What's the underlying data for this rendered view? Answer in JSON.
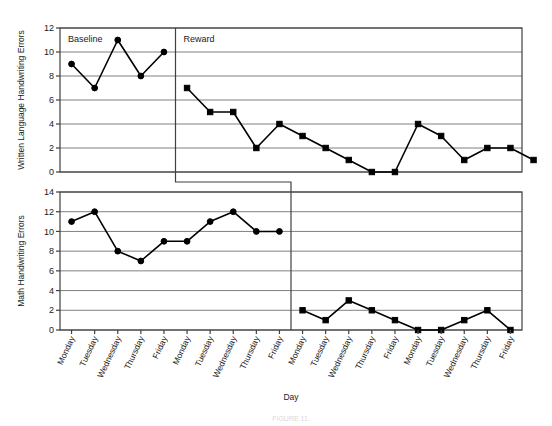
{
  "figure": {
    "xlabel": "Day",
    "caption": "FIGURE 11."
  },
  "chart_data": [
    {
      "type": "line",
      "title": "",
      "xlabel": "Day",
      "ylabel": "Written Language Handwriting Errors",
      "ylim": [
        0,
        12
      ],
      "yticks": [
        0,
        2,
        4,
        6,
        8,
        10,
        12
      ],
      "grid": true,
      "legend": "none",
      "categories": [
        "Monday",
        "Tuesday",
        "Wednesday",
        "Thursday",
        "Friday",
        "Monday",
        "Tuesday",
        "Wednesday",
        "Thursday",
        "Friday",
        "Monday",
        "Tuesday",
        "Wednesday",
        "Thursday",
        "Friday",
        "Monday",
        "Tuesday",
        "Wednesday",
        "Thursday",
        "Friday"
      ],
      "phases": [
        {
          "label": "Baseline",
          "marker": "circle",
          "start_index": 0,
          "end_index": 4,
          "values": [
            9,
            7,
            11,
            8,
            10
          ]
        },
        {
          "label": "Reward",
          "marker": "square",
          "start_index": 5,
          "end_index": 19,
          "values": [
            7,
            5,
            5,
            2,
            4,
            3,
            2,
            1,
            0,
            0,
            4,
            3,
            1,
            2,
            2,
            1
          ]
        }
      ],
      "values": [
        9,
        7,
        11,
        8,
        10,
        7,
        5,
        5,
        2,
        4,
        3,
        2,
        1,
        0,
        0,
        4,
        3,
        1,
        2,
        2,
        1
      ],
      "phase_change_after_index": 4
    },
    {
      "type": "line",
      "title": "",
      "xlabel": "Day",
      "ylabel": "Math Handwriting Errors",
      "ylim": [
        0,
        14
      ],
      "yticks": [
        0,
        2,
        4,
        6,
        8,
        10,
        12,
        14
      ],
      "grid": true,
      "legend": "none",
      "categories": [
        "Monday",
        "Tuesday",
        "Wednesday",
        "Thursday",
        "Friday",
        "Monday",
        "Tuesday",
        "Wednesday",
        "Thursday",
        "Friday",
        "Monday",
        "Tuesday",
        "Wednesday",
        "Thursday",
        "Friday",
        "Monday",
        "Tuesday",
        "Wednesday",
        "Thursday",
        "Friday"
      ],
      "phases": [
        {
          "label": "Baseline",
          "marker": "circle",
          "start_index": 0,
          "end_index": 10,
          "values": [
            11,
            12,
            8,
            7,
            9,
            9,
            11,
            12,
            10,
            10
          ]
        },
        {
          "label": "Reward",
          "marker": "square",
          "start_index": 11,
          "end_index": 19,
          "values": [
            2,
            1,
            3,
            2,
            1,
            0,
            0,
            1,
            2,
            0
          ]
        }
      ],
      "values": [
        11,
        12,
        8,
        7,
        9,
        9,
        11,
        12,
        10,
        10,
        2,
        1,
        3,
        2,
        1,
        0,
        0,
        1,
        2,
        0
      ],
      "phase_change_after_index": 9
    }
  ]
}
